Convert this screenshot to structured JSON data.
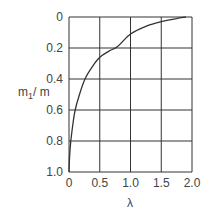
{
  "chart_data": {
    "type": "line",
    "title": "",
    "xlabel": "λ",
    "ylabel": "m1/ m",
    "ylabel_main": "m",
    "ylabel_sub": "1",
    "ylabel_tail": "/ m",
    "xlim": [
      0,
      2.0
    ],
    "ylim": [
      0,
      1.0
    ],
    "y_inverted": true,
    "grid": true,
    "x_ticks": [
      "0",
      "0.5",
      "1.0",
      "1.5",
      "2.0"
    ],
    "y_ticks": [
      "0",
      "0.2",
      "0.4",
      "0.6",
      "0.8",
      "1.0"
    ],
    "series": [
      {
        "name": "m1/m vs λ",
        "x": [
          0.0,
          0.01,
          0.03,
          0.06,
          0.1,
          0.17,
          0.26,
          0.38,
          0.5,
          0.65,
          0.79,
          1.0,
          1.25,
          1.5,
          1.75,
          1.9
        ],
        "y": [
          1.0,
          0.9,
          0.8,
          0.7,
          0.6,
          0.5,
          0.4,
          0.32,
          0.26,
          0.22,
          0.19,
          0.11,
          0.06,
          0.03,
          0.01,
          0.0
        ]
      }
    ]
  }
}
